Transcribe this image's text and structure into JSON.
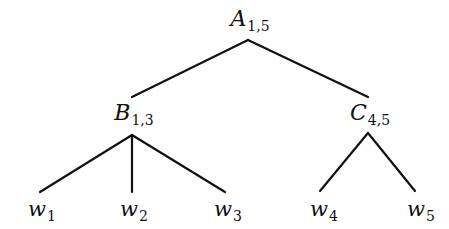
{
  "diagram": {
    "type": "tree",
    "nodes": {
      "A": {
        "symbol": "A",
        "sub": "1,5"
      },
      "B": {
        "symbol": "B",
        "sub": "1,3"
      },
      "C": {
        "symbol": "C",
        "sub": "4,5"
      },
      "w1": {
        "symbol": "w",
        "sub": "1"
      },
      "w2": {
        "symbol": "w",
        "sub": "2"
      },
      "w3": {
        "symbol": "w",
        "sub": "3"
      },
      "w4": {
        "symbol": "w",
        "sub": "4"
      },
      "w5": {
        "symbol": "w",
        "sub": "5"
      }
    },
    "edges": [
      [
        "A",
        "B"
      ],
      [
        "A",
        "C"
      ],
      [
        "B",
        "w1"
      ],
      [
        "B",
        "w2"
      ],
      [
        "B",
        "w3"
      ],
      [
        "C",
        "w4"
      ],
      [
        "C",
        "w5"
      ]
    ],
    "line_color": "#111111"
  }
}
